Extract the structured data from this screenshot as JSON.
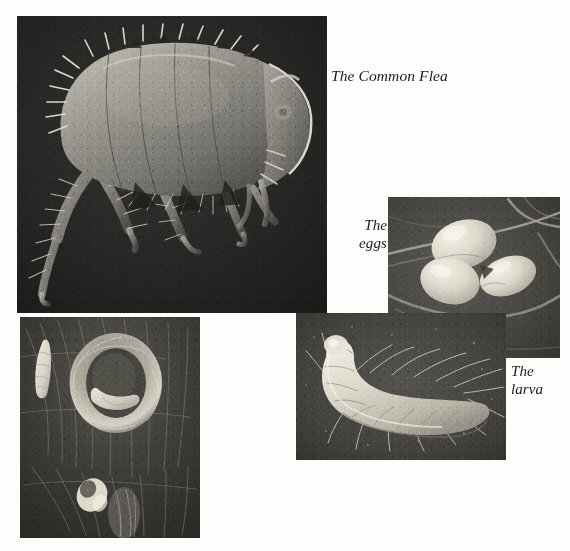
{
  "page": {
    "width": 570,
    "height": 551,
    "background": "#fdfdfc",
    "kind": "printed-book-page-figure"
  },
  "captions": {
    "flea": "The Common Flea",
    "eggs": "The\neggs",
    "larva": "The\nlarva"
  },
  "figures": [
    {
      "id": "adult-flea",
      "name": "adult-flea-photo",
      "caption": "The Common Flea",
      "description": "scanning electron micrograph of an adult flea in left lateral view, body arched, spines and bristles on head, thorax and legs, hind leg extended downward",
      "rect": {
        "x": 17,
        "y": 16,
        "w": 310,
        "h": 297
      },
      "tone": {
        "background": "#262626",
        "subject_light": "#b9b6ae",
        "subject_mid": "#6f6d67",
        "highlight": "#e7e4dc"
      }
    },
    {
      "id": "flea-eggs",
      "name": "flea-eggs-photo",
      "caption": "The eggs",
      "description": "three pale oval flea eggs clustered together among dark animal hairs",
      "rect": {
        "x": 388,
        "y": 197,
        "w": 172,
        "h": 161
      },
      "tone": {
        "background": "#4a4946",
        "subject_light": "#dedacd",
        "subject_mid": "#a8a49a",
        "highlight": "#f1eee5"
      }
    },
    {
      "id": "flea-larva",
      "name": "flea-larva-photo",
      "caption": "The larva",
      "description": "pale segmented legless flea larva curved in a C shape with long sparse bristles along the body, on dark debris background",
      "rect": {
        "x": 296,
        "y": 313,
        "w": 210,
        "h": 147
      },
      "tone": {
        "background": "#46443f",
        "subject_light": "#dcd8cb",
        "subject_mid": "#aaa69a",
        "highlight": "#f0ede3"
      }
    },
    {
      "id": "flea-pupa",
      "name": "flea-pupa-photo",
      "caption": "",
      "description": "dark close-up of animal fur with a pale cocoon/pupa ring, a loose pale larva at upper left and a small pale pupal case at lower centre",
      "rect": {
        "x": 20,
        "y": 317,
        "w": 180,
        "h": 221
      },
      "tone": {
        "background": "#3b3a36",
        "subject_light": "#cfcabc",
        "subject_mid": "#8d8a80",
        "highlight": "#eeeae0"
      }
    }
  ]
}
